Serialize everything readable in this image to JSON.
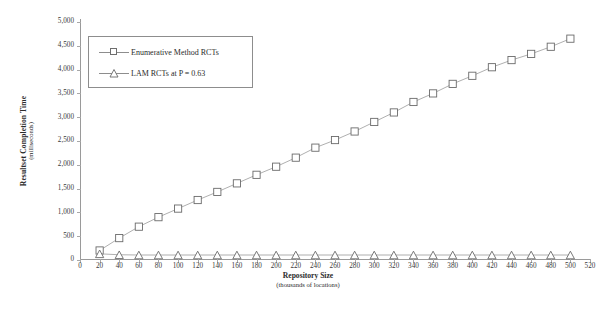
{
  "chart_data": {
    "type": "line",
    "title": "",
    "xlabel": "Repository Size",
    "xlabel_sub": "(thousands of locations)",
    "ylabel": "Resultset Completion Time",
    "ylabel_sub": "(milliseconds)",
    "xlim": [
      0,
      520
    ],
    "ylim": [
      0,
      5000
    ],
    "xticks": [
      0,
      20,
      40,
      60,
      80,
      100,
      120,
      140,
      160,
      180,
      200,
      220,
      240,
      260,
      280,
      300,
      320,
      340,
      360,
      380,
      400,
      420,
      440,
      460,
      480,
      500,
      520
    ],
    "xtick_labels": [
      "0",
      "20",
      "40",
      "60",
      "80",
      "100",
      "120",
      "140",
      "160",
      "180",
      "200",
      "220",
      "240",
      "260",
      "280",
      "300",
      "320",
      "340",
      "360",
      "380",
      "400",
      "420",
      "440",
      "460",
      "480",
      "500",
      "520"
    ],
    "yticks": [
      0,
      500,
      1000,
      1500,
      2000,
      2500,
      3000,
      3500,
      4000,
      4500,
      5000
    ],
    "ytick_labels": [
      "0",
      "500",
      "1,000",
      "1,500",
      "2,000",
      "2,500",
      "3,000",
      "3,500",
      "4,000",
      "4,500",
      "5,000"
    ],
    "grid": false,
    "legend_position": "upper left",
    "x": [
      20,
      40,
      60,
      80,
      100,
      120,
      140,
      160,
      180,
      200,
      220,
      240,
      260,
      280,
      300,
      320,
      340,
      360,
      380,
      400,
      420,
      440,
      460,
      480,
      500
    ],
    "series": [
      {
        "name": "Enumerative Method RCTs",
        "marker": "square",
        "values": [
          200,
          460,
          700,
          900,
          1080,
          1260,
          1430,
          1610,
          1790,
          1960,
          2150,
          2360,
          2520,
          2700,
          2900,
          3100,
          3320,
          3500,
          3700,
          3870,
          4050,
          4200,
          4330,
          4480,
          4650
        ]
      },
      {
        "name": "LAM RCTs at P = 0.63",
        "marker": "triangle",
        "values": [
          130,
          110,
          105,
          105,
          105,
          105,
          105,
          105,
          105,
          105,
          105,
          105,
          105,
          105,
          105,
          105,
          105,
          105,
          105,
          105,
          105,
          105,
          105,
          105,
          105
        ]
      }
    ],
    "colors": {
      "line": "#9b9b9b",
      "marker_stroke": "#6a6a6a",
      "marker_fill": "#ffffff",
      "axis": "#9a9a9a",
      "text": "#2b2b2b",
      "background": "#ffffff"
    }
  },
  "legend": {
    "entries": [
      {
        "label": "Enumerative Method RCTs",
        "marker": "square-marker"
      },
      {
        "label": "LAM RCTs at P = 0.63",
        "marker": "triangle-marker"
      }
    ]
  }
}
